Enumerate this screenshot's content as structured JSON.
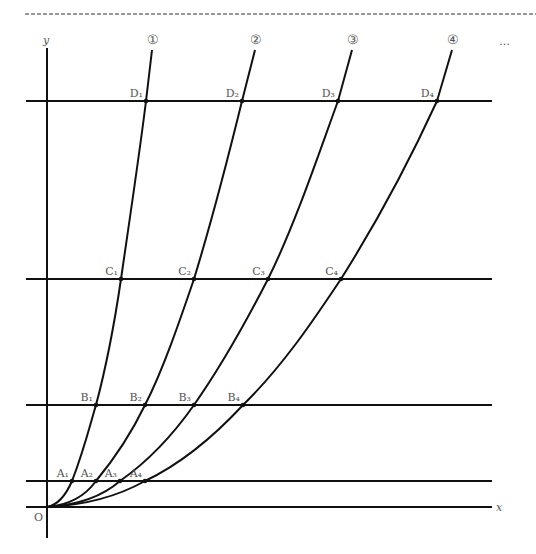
{
  "figure": {
    "axes": {
      "x_label": "x",
      "y_label": "y",
      "origin_label": "O"
    },
    "ellipsis": "…",
    "curves": [
      {
        "label": "①",
        "top": [
          152,
          50
        ],
        "path": "M47,507 C58,505 66,495 72,481 C84,450 90,425 96,405 C108,360 115,320 121,279 C131,210 140,150 146,101 L152,50"
      },
      {
        "label": "②",
        "top": [
          255,
          50
        ],
        "path": "M47,507 C70,505 86,495 96,481 C115,458 132,432 145,405 C163,370 180,320 194,279 C212,220 230,150 242,101 L255,50"
      },
      {
        "label": "③",
        "top": [
          352,
          50
        ],
        "path": "M47,507 C80,505 104,495 120,481 C150,460 175,432 194,405 C220,368 247,320 268,279 C295,225 320,150 338,101 L352,50"
      },
      {
        "label": "④",
        "top": [
          452,
          50
        ],
        "path": "M47,507 C90,505 120,495 145,481 C185,462 218,432 243,405 C283,366 315,318 341,279 C375,225 410,160 437,101 L452,50"
      }
    ],
    "horizontal_lines": [
      {
        "name": "D",
        "y": 101
      },
      {
        "name": "C",
        "y": 279
      },
      {
        "name": "B",
        "y": 405
      },
      {
        "name": "A",
        "y": 481
      }
    ],
    "points": [
      {
        "label": "D₁",
        "x": 146,
        "y": 101
      },
      {
        "label": "D₂",
        "x": 242,
        "y": 101
      },
      {
        "label": "D₃",
        "x": 338,
        "y": 101
      },
      {
        "label": "D₄",
        "x": 437,
        "y": 101
      },
      {
        "label": "C₁",
        "x": 121,
        "y": 279
      },
      {
        "label": "C₂",
        "x": 194,
        "y": 279
      },
      {
        "label": "C₃",
        "x": 268,
        "y": 279
      },
      {
        "label": "C₄",
        "x": 341,
        "y": 279
      },
      {
        "label": "B₁",
        "x": 96,
        "y": 405
      },
      {
        "label": "B₂",
        "x": 145,
        "y": 405
      },
      {
        "label": "B₃",
        "x": 194,
        "y": 405
      },
      {
        "label": "B₄",
        "x": 243,
        "y": 405
      },
      {
        "label": "A₁",
        "x": 72,
        "y": 481
      },
      {
        "label": "A₂",
        "x": 96,
        "y": 481
      },
      {
        "label": "A₃",
        "x": 120,
        "y": 481
      },
      {
        "label": "A₄",
        "x": 145,
        "y": 481
      }
    ]
  }
}
